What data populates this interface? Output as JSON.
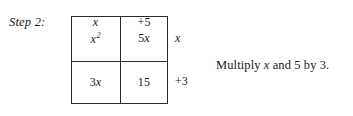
{
  "step": {
    "label": "Step 2:"
  },
  "area_model": {
    "column_headers": [
      "x",
      "+5"
    ],
    "row_labels": [
      "x",
      "+3"
    ],
    "cells": [
      [
        {
          "base": "x",
          "exponent": "2",
          "italic_base": true
        },
        {
          "coefficient": "5",
          "variable": "x"
        }
      ],
      [
        {
          "coefficient": "3",
          "variable": "x"
        },
        {
          "constant": "15"
        }
      ]
    ],
    "cell_text": [
      [
        "x2",
        "5x"
      ],
      [
        "3x",
        "15"
      ]
    ]
  },
  "annotation": {
    "prefix": "Multiply ",
    "variable": "x",
    "suffix": " and 5 by 3."
  },
  "colors": {
    "ink": "#1a1a1a",
    "rule": "#2b2b2b",
    "background": "#ffffff"
  }
}
